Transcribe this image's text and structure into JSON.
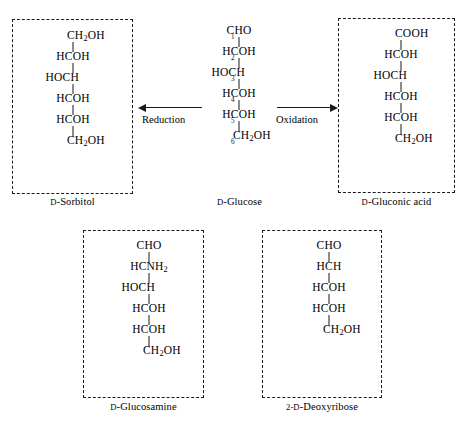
{
  "figure": {
    "text_color": "#1a1a1a",
    "background": "#ffffff"
  },
  "center_structure": {
    "name": "d-glucose",
    "caption_prefix": "D",
    "caption_rest": "-Glucose",
    "numbered": true,
    "rows": [
      {
        "number": "1",
        "text": "CHO",
        "align": "center"
      },
      {
        "number": "2",
        "text": "HCOH",
        "align": "center"
      },
      {
        "number": "3",
        "text": "HOCH",
        "align": "left"
      },
      {
        "number": "4",
        "text": "HCOH",
        "align": "center"
      },
      {
        "number": "5",
        "text": "HCOH",
        "align": "center"
      },
      {
        "number": "6",
        "text": "CH2OH",
        "align": "right"
      }
    ]
  },
  "products": [
    {
      "id": "sorbitol",
      "name": "d-sorbitol",
      "caption_prefix": "D",
      "caption_rest": "-Sorbitol",
      "rows": [
        {
          "text": "CH2OH",
          "align": "right"
        },
        {
          "text": "HCOH",
          "align": "center"
        },
        {
          "text": "HOCH",
          "align": "left"
        },
        {
          "text": "HCOH",
          "align": "center"
        },
        {
          "text": "HCOH",
          "align": "center"
        },
        {
          "text": "CH2OH",
          "align": "right"
        }
      ]
    },
    {
      "id": "gluconic-acid",
      "name": "d-gluconic-acid",
      "caption_prefix": "D",
      "caption_rest": "-Gluconic acid",
      "rows": [
        {
          "text": "COOH",
          "align": "right"
        },
        {
          "text": "HCOH",
          "align": "center"
        },
        {
          "text": "HOCH",
          "align": "left"
        },
        {
          "text": "HCOH",
          "align": "center"
        },
        {
          "text": "HCOH",
          "align": "center"
        },
        {
          "text": "CH2OH",
          "align": "right"
        }
      ]
    },
    {
      "id": "glucosamine",
      "name": "d-glucosamine",
      "caption_prefix": "D",
      "caption_rest": "-Glucosamine",
      "rows": [
        {
          "text": "CHO",
          "align": "center"
        },
        {
          "text": "HCNH2",
          "align": "center"
        },
        {
          "text": "HOCH",
          "align": "left"
        },
        {
          "text": "HCOH",
          "align": "center"
        },
        {
          "text": "HCOH",
          "align": "center"
        },
        {
          "text": "CH2OH",
          "align": "right"
        }
      ]
    },
    {
      "id": "deoxyribose",
      "name": "2-d-deoxyribose",
      "caption_prefix": "2-D",
      "caption_rest": "-Deoxyribose",
      "rows": [
        {
          "text": "CHO",
          "align": "center"
        },
        {
          "text": "HCH",
          "align": "center"
        },
        {
          "text": "HCOH",
          "align": "center"
        },
        {
          "text": "HCOH",
          "align": "center"
        },
        {
          "text": "CH2OH",
          "align": "right"
        }
      ]
    }
  ],
  "arrows": [
    {
      "id": "reduction",
      "label": "Reduction",
      "direction": "left"
    },
    {
      "id": "oxidation",
      "label": "Oxidation",
      "direction": "right"
    }
  ]
}
